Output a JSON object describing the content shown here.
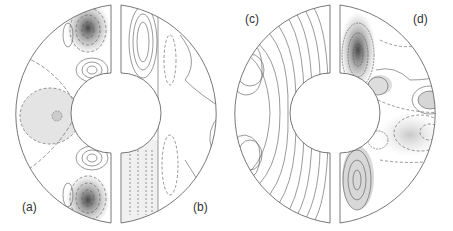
{
  "figure": {
    "panels": [
      {
        "id": "a",
        "label": "(a)",
        "description": "left half of first annulus, shaded contours with dashed negative levels"
      },
      {
        "id": "b",
        "label": "(b)",
        "description": "right half of first annulus, streamline-like contours"
      },
      {
        "id": "c",
        "label": "(c)",
        "description": "left half of second annulus, solid closed contours"
      },
      {
        "id": "d",
        "label": "(d)",
        "description": "right half of second annulus, shaded contours"
      }
    ],
    "colors": {
      "line": "#555555",
      "dark_shade": "#333333",
      "light_shade": "#d8d8d8",
      "background": "#ffffff"
    }
  }
}
